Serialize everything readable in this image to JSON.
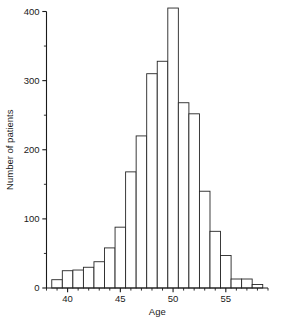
{
  "chart_data": {
    "type": "bar",
    "title": "",
    "subtitle": "",
    "xlabel": "Age",
    "ylabel": "Number of patients",
    "xlim": [
      38.0,
      59.0
    ],
    "ylim": [
      0,
      400
    ],
    "grid": false,
    "legend": null,
    "bin_width": 1,
    "x_tick_labels": [
      "40",
      "45",
      "50",
      "55"
    ],
    "x_tick_values": [
      40,
      45,
      50,
      55
    ],
    "x_minor_tick_step": 1,
    "y_tick_labels": [
      "0",
      "100",
      "200",
      "300",
      "400"
    ],
    "y_tick_values": [
      0,
      100,
      200,
      300,
      400
    ],
    "y_minor_tick_step": 50,
    "categories": [
      "38-39",
      "39-40",
      "40-41",
      "41-42",
      "42-43",
      "43-44",
      "44-45",
      "45-46",
      "46-47",
      "47-48",
      "48-49",
      "49-50",
      "50-51",
      "51-52",
      "52-53",
      "53-54",
      "54-55",
      "55-56",
      "56-57",
      "57-58",
      "58-59"
    ],
    "bin_starts": [
      38.5,
      39.5,
      40.5,
      41.5,
      42.5,
      43.5,
      44.5,
      45.5,
      46.5,
      47.5,
      48.5,
      49.5,
      50.5,
      51.5,
      52.5,
      53.5,
      54.5,
      55.5,
      56.5,
      57.5,
      58.5
    ],
    "values": [
      12,
      25,
      26,
      30,
      38,
      58,
      88,
      168,
      220,
      310,
      328,
      405,
      268,
      252,
      140,
      82,
      47,
      13,
      13,
      5,
      0
    ],
    "series": [
      {
        "name": "Number of patients",
        "values": [
          12,
          25,
          26,
          30,
          38,
          58,
          88,
          168,
          220,
          310,
          328,
          405,
          268,
          252,
          140,
          82,
          47,
          13,
          13,
          5,
          0
        ]
      }
    ],
    "peak_bin": "50-51",
    "peak_value": 405,
    "annotations": [],
    "colors": {
      "bar_fill": "#ffffff",
      "bar_stroke": "#262626",
      "axis": "#1a1a1a",
      "text": "#1a1a1a",
      "background": "#ffffff"
    }
  }
}
